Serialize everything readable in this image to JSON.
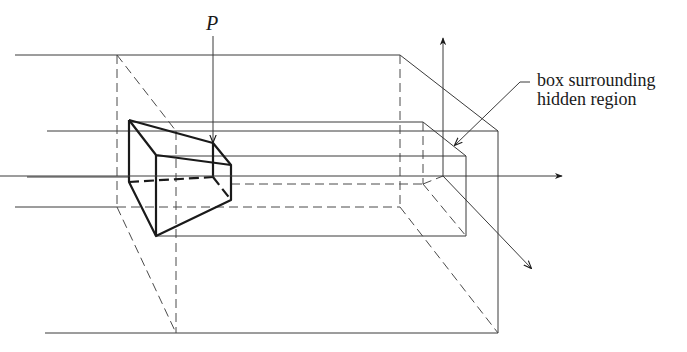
{
  "figure": {
    "labels": {
      "point_label": "P",
      "annotation_line1": "box surrounding",
      "annotation_line2": "hidden region"
    },
    "colors": {
      "background": "#ffffff",
      "line": "#1a1a1a"
    },
    "elements": [
      "outer-box",
      "inner-box",
      "frustum",
      "axis-up",
      "axis-right",
      "axis-diagonal",
      "pointer-p",
      "annotation-leader"
    ]
  }
}
